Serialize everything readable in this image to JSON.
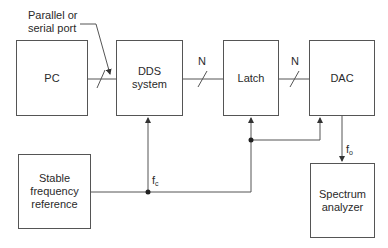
{
  "diagram": {
    "type": "block-diagram",
    "blocks": {
      "pc": {
        "label": "PC"
      },
      "dds": {
        "label_line1": "DDS",
        "label_line2": "system"
      },
      "latch": {
        "label": "Latch"
      },
      "dac": {
        "label": "DAC"
      },
      "reference": {
        "label_line1": "Stable",
        "label_line2": "frequency",
        "label_line3": "reference"
      },
      "spectrum": {
        "label_line1": "Spectrum",
        "label_line2": "analyzer"
      }
    },
    "annotations": {
      "port_line1": "Parallel or",
      "port_line2": "serial port",
      "bus_width_1": "N",
      "bus_width_2": "N",
      "clock_main": "f",
      "clock_sub": "c",
      "output_main": "f",
      "output_sub": "o"
    },
    "connections": [
      {
        "from": "PC",
        "to": "DDS system",
        "type": "bus",
        "label": "Parallel or serial port"
      },
      {
        "from": "DDS system",
        "to": "Latch",
        "type": "bus",
        "label": "N"
      },
      {
        "from": "Latch",
        "to": "DAC",
        "type": "bus",
        "label": "N"
      },
      {
        "from": "Stable frequency reference",
        "to": "DDS system",
        "label": "fc"
      },
      {
        "from": "Stable frequency reference",
        "to": "Latch",
        "label": "fc"
      },
      {
        "from": "Stable frequency reference",
        "to": "DAC",
        "label": "fc"
      },
      {
        "from": "DAC",
        "to": "Spectrum analyzer",
        "label": "fo"
      }
    ]
  }
}
